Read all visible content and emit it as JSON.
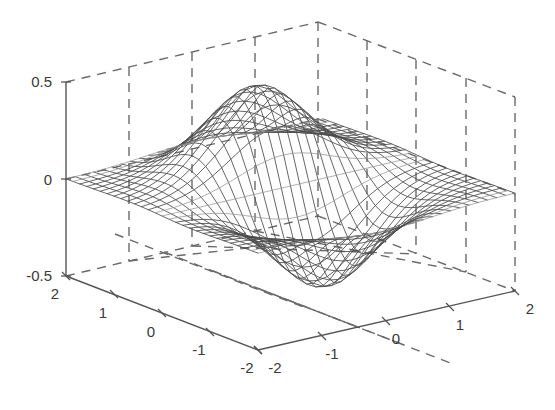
{
  "figure": {
    "title": "",
    "background_color": "#ffffff",
    "width": 555,
    "height": 410
  },
  "axes": {
    "z": {
      "label": "",
      "ticks": [
        "0.5",
        "0",
        "-0.5"
      ],
      "range": [
        -0.5,
        0.5
      ],
      "position": "left-vertical"
    },
    "x": {
      "label": "",
      "ticks": [
        "2",
        "1",
        "0",
        "-1",
        "-2"
      ],
      "range": [
        -2,
        2
      ],
      "position": "left-front-floor"
    },
    "y": {
      "label": "",
      "ticks": [
        "-2",
        "-1",
        "0",
        "1",
        "2"
      ],
      "range": [
        -2,
        2
      ],
      "position": "right-front-floor"
    },
    "grid": "on",
    "grid_style": "dashed",
    "box": "on",
    "line_color": "#555555"
  },
  "chart_data": {
    "type": "line",
    "render_as": "3d-mesh-surface",
    "title": "",
    "xlabel": "",
    "ylabel": "",
    "zlabel": "",
    "xlim": [
      -2,
      2
    ],
    "ylim": [
      -2,
      2
    ],
    "zlim": [
      -0.5,
      0.5
    ],
    "xticks": [
      2,
      1,
      0,
      -1,
      -2
    ],
    "yticks": [
      -2,
      -1,
      0,
      1,
      2
    ],
    "zticks": [
      0.5,
      0,
      -0.5
    ],
    "grid": true,
    "legend": "none",
    "colormap": "grayscale-wireframe",
    "mesh_resolution": {
      "nx": 29,
      "ny": 29
    },
    "surface_function": "z = x * exp(-x^2 - y^2) scaled to peak 0.45",
    "features": [
      {
        "name": "peak",
        "x": -0.72,
        "y": 0.0,
        "z": 0.45
      },
      {
        "name": "trough",
        "x": 0.72,
        "y": 0.0,
        "z": -0.45
      },
      {
        "name": "flat-plane",
        "x": 2.0,
        "y": 2.0,
        "z": 0.0
      }
    ],
    "z_min": -0.45,
    "z_max": 0.45
  },
  "projection": {
    "type": "axonometric",
    "origin_front": {
      "x": 258,
      "y": 350
    },
    "corner_left": {
      "x": 66,
      "y": 276
    },
    "corner_right": {
      "x": 515,
      "y": 290
    },
    "corner_back": {
      "x": 318,
      "y": 212
    },
    "z_height_px": 194
  }
}
